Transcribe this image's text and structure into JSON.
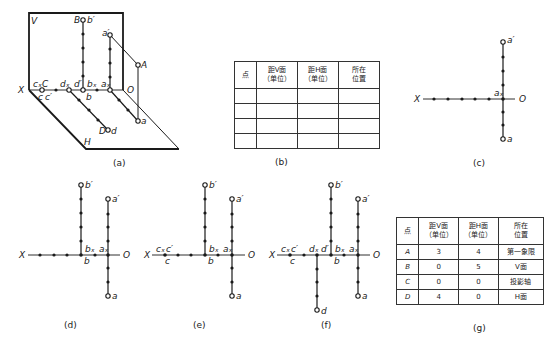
{
  "figure": {
    "captions": {
      "a": "(a)",
      "b": "(b)",
      "c": "(c)",
      "d": "(d)",
      "e": "(e)",
      "f": "(f)",
      "g": "(g)"
    },
    "panel_a": {
      "plane_V": "V",
      "plane_H": "H",
      "axis_X": "X",
      "origin": "O",
      "point_labels": {
        "B": "B",
        "b_prime": "b′",
        "a_prime": "a′",
        "A": "A",
        "cx": "cₓ",
        "C": "C",
        "c": "c",
        "c_prime": "c′",
        "dx": "dₓ",
        "d_prime": "d′",
        "bx": "bₓ",
        "b": "b",
        "ax": "aₓ",
        "a": "a",
        "D": "D",
        "d": "d"
      }
    },
    "panel_c": {
      "axis_X": "X",
      "origin": "O",
      "a_prime": "a′",
      "ax": "aₓ",
      "a": "a"
    },
    "panel_d": {
      "axis_X": "X",
      "origin": "O",
      "b_prime": "b′",
      "a_prime": "a′",
      "bx": "bₓ",
      "ax": "aₓ",
      "b": "b",
      "a": "a"
    },
    "panel_e": {
      "axis_X": "X",
      "origin": "O",
      "cx": "cₓ",
      "c_prime": "c′",
      "c": "c",
      "b_prime": "b′",
      "a_prime": "a′",
      "bx": "bₓ",
      "ax": "aₓ",
      "b": "b",
      "a": "a"
    },
    "panel_f": {
      "axis_X": "X",
      "origin": "O",
      "cx": "cₓ",
      "c_prime": "c′",
      "c": "c",
      "dx": "dₓ",
      "d_prime": "d′",
      "d": "d",
      "b_prime": "b′",
      "a_prime": "a′",
      "bx": "bₓ",
      "ax": "aₓ",
      "b": "b",
      "a": "a"
    },
    "table_b": {
      "headers": [
        "点",
        "距V面",
        "（单位）",
        "距H面",
        "（单位）",
        "所在",
        "位置"
      ],
      "rows": [
        [
          "",
          "",
          "",
          ""
        ],
        [
          "",
          "",
          "",
          ""
        ],
        [
          "",
          "",
          "",
          ""
        ],
        [
          "",
          "",
          "",
          ""
        ]
      ]
    },
    "table_g": {
      "headers": [
        "点",
        "距V面",
        "（单位）",
        "距H面",
        "（单位）",
        "所在",
        "位置"
      ],
      "rows": [
        [
          "A",
          "3",
          "4",
          "第一象限"
        ],
        [
          "B",
          "0",
          "5",
          "V面"
        ],
        [
          "C",
          "0",
          "0",
          "投影轴"
        ],
        [
          "D",
          "4",
          "0",
          "H面"
        ]
      ]
    }
  }
}
